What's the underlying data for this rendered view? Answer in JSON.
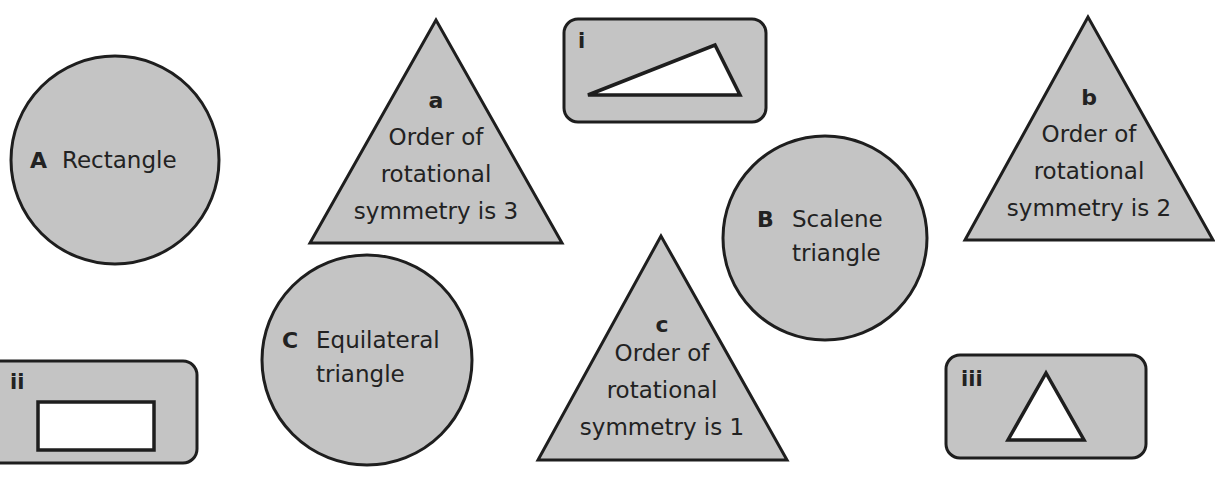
{
  "colors": {
    "shape_fill": "#c4c4c4",
    "outline": "#1e1e1e",
    "inner_fill": "#ffffff",
    "text": "#222222"
  },
  "circles": [
    {
      "key": "A",
      "lines": [
        "Rectangle"
      ]
    },
    {
      "key": "B",
      "lines": [
        "Scalene",
        "triangle"
      ]
    },
    {
      "key": "C",
      "lines": [
        "Equilateral",
        "triangle"
      ]
    }
  ],
  "triangles": [
    {
      "key": "a",
      "lines": [
        "Order of",
        "rotational",
        "symmetry is 3"
      ]
    },
    {
      "key": "b",
      "lines": [
        "Order of",
        "rotational",
        "symmetry is 2"
      ]
    },
    {
      "key": "c",
      "lines": [
        "Order of",
        "rotational",
        "symmetry is 1"
      ]
    }
  ],
  "cards": [
    {
      "label": "i",
      "shape": "scalene-triangle"
    },
    {
      "label": "ii",
      "shape": "rectangle"
    },
    {
      "label": "iii",
      "shape": "equilateral-triangle"
    }
  ]
}
